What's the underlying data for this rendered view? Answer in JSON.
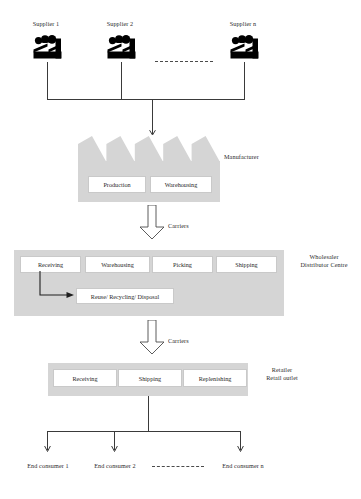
{
  "diagram": {
    "colors": {
      "band_grey": "#d5d5d5",
      "line": "#3a3a3a",
      "box_fill": "#ffffff",
      "box_border": "#c9c9c9",
      "text": "#1f1f1f"
    }
  },
  "suppliers": {
    "items": [
      {
        "label": "Supplier 1",
        "icon": "factory-icon"
      },
      {
        "label": "Supplier 2",
        "icon": "factory-icon"
      },
      {
        "label": "Supplier n",
        "icon": "factory-icon"
      }
    ],
    "ellipsis": "dashed-line-separator"
  },
  "manufacturer": {
    "label": "Manufacturer",
    "boxes": [
      {
        "label": "Production"
      },
      {
        "label": "Warehousing"
      }
    ]
  },
  "carriers_upper": {
    "label": "Carriers",
    "icon": "down-block-arrow-icon"
  },
  "wholesaler": {
    "label_line1": "Wholesaler",
    "label_line2": "Distributor Centre",
    "boxes": [
      {
        "label": "Receiving"
      },
      {
        "label": "Warehousing"
      },
      {
        "label": "Picking"
      },
      {
        "label": "Shipping"
      }
    ],
    "reverse_logistics": {
      "label": "Reuse/ Recycling/ Disposal"
    }
  },
  "carriers_lower": {
    "label": "Carriers",
    "icon": "down-block-arrow-icon"
  },
  "retailer": {
    "label_line1": "Retailer",
    "label_line2": "Retail outlet",
    "boxes": [
      {
        "label": "Receiving"
      },
      {
        "label": "Shipping"
      },
      {
        "label": "Replenishing"
      }
    ]
  },
  "consumers": {
    "items": [
      {
        "label": "End consumer 1"
      },
      {
        "label": "End consumer 2"
      },
      {
        "label": "End consumer n"
      }
    ],
    "ellipsis": "dashed-line-separator"
  }
}
